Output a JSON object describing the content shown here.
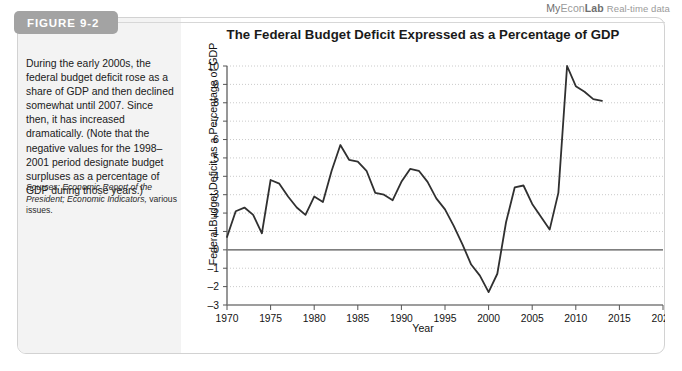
{
  "brand": {
    "my": "My",
    "econ": "Econ",
    "lab": "Lab",
    "realtime": "Real-time data"
  },
  "figure": {
    "tab_label": "FIGURE 9-2",
    "title": "The Federal Budget Deficit Expressed as a Percentage of GDP",
    "caption": "During the early 2000s, the federal budget deficit rose as a share of GDP and then declined somewhat until 2007. Since then, it has increased dramatically. (Note that the negative values for the 1998–2001 period designate budget surpluses as a percentage of GDP during those years.)",
    "sources_label": "Sources:",
    "sources_italic": "Economic Report of the President; Economic Indicators,",
    "sources_tail": " various issues."
  },
  "chart_data": {
    "type": "line",
    "title": "The Federal Budget Deficit Expressed as a Percentage of GDP",
    "xlabel": "Year",
    "ylabel": "Federal Budget Deficit as a Percentage of GDP",
    "xlim": [
      1970,
      2020
    ],
    "ylim": [
      -3,
      10
    ],
    "xticks": [
      1970,
      1975,
      1980,
      1985,
      1990,
      1995,
      2000,
      2005,
      2010,
      2015,
      2020
    ],
    "yticks": [
      -3,
      -2,
      -1,
      0,
      1,
      2,
      3,
      4,
      5,
      6,
      7,
      8,
      9,
      10
    ],
    "grid": "horizontal-dotted",
    "zero_line": true,
    "legend": "none",
    "line_color": "#303030",
    "series": [
      {
        "name": "Federal budget deficit as a percentage of GDP",
        "x": [
          1970,
          1971,
          1972,
          1973,
          1974,
          1975,
          1976,
          1977,
          1978,
          1979,
          1980,
          1981,
          1982,
          1983,
          1984,
          1985,
          1986,
          1987,
          1988,
          1989,
          1990,
          1991,
          1992,
          1993,
          1994,
          1995,
          1996,
          1997,
          1998,
          1999,
          2000,
          2001,
          2002,
          2003,
          2004,
          2005,
          2006,
          2007,
          2008,
          2009,
          2010,
          2011,
          2012,
          2013
        ],
        "values": [
          0.7,
          2.1,
          2.3,
          1.9,
          0.9,
          3.8,
          3.6,
          2.9,
          2.3,
          1.9,
          2.9,
          2.6,
          4.3,
          5.7,
          4.9,
          4.8,
          4.3,
          3.1,
          3.0,
          2.7,
          3.7,
          4.4,
          4.3,
          3.7,
          2.8,
          2.2,
          1.3,
          0.3,
          -0.8,
          -1.4,
          -2.3,
          -1.3,
          1.5,
          3.4,
          3.5,
          2.5,
          1.8,
          1.1,
          3.1,
          10.0,
          8.9,
          8.6,
          8.2,
          8.1
        ]
      }
    ]
  }
}
